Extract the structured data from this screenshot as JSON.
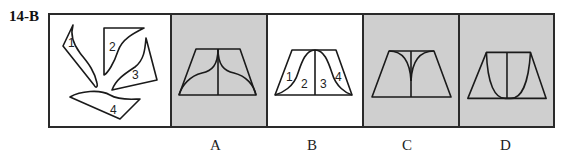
{
  "question": {
    "label": "14-B"
  },
  "colors": {
    "line": "#1a1a1a",
    "gray_fill": "#cfcfcf",
    "white_fill": "#ffffff"
  },
  "pieces_panel": {
    "pieces": [
      {
        "label": "1"
      },
      {
        "label": "2"
      },
      {
        "label": "3"
      },
      {
        "label": "4"
      }
    ]
  },
  "options": [
    {
      "label": "A",
      "fill": "gray"
    },
    {
      "label": "B",
      "fill": "white",
      "section_labels": [
        "1",
        "2",
        "3",
        "4"
      ]
    },
    {
      "label": "C",
      "fill": "gray"
    },
    {
      "label": "D",
      "fill": "gray"
    }
  ]
}
